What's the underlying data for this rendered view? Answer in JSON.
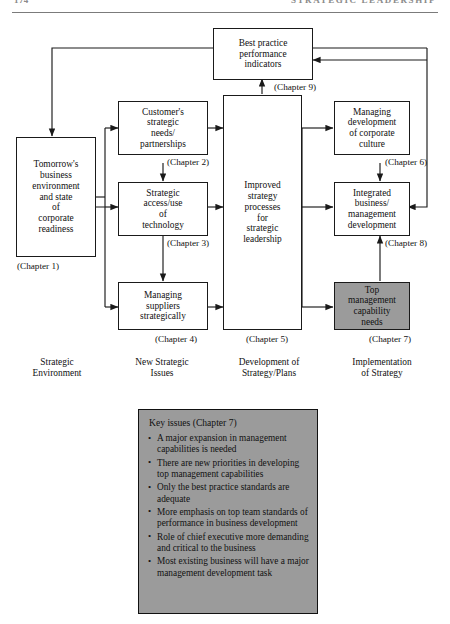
{
  "runhead": {
    "folio": "174",
    "title": "STRATEGIC LEADERSHIP"
  },
  "diagram": {
    "boxes": {
      "best_practice": "Best practice\nperformance\nindicators",
      "tomorrow": "Tomorrow's\nbusiness\nenvironment\nand state\nof\ncorporate\nreadiness",
      "customers": "Customer's\nstrategic\nneeds/\npartnerships",
      "technology": "Strategic\naccess/use\nof\ntechnology",
      "suppliers": "Managing\nsuppliers\nstrategically",
      "improved": "Improved\nstrategy\nprocesses\nfor\nstrategic\nleadership",
      "culture": "Managing\ndevelopment\nof corporate\nculture",
      "integrated": "Integrated\nbusiness/\nmanagement\ndevelopment",
      "topmgmt": "Top\nmanagement\ncapability\nneeds"
    },
    "chapters": {
      "best_practice": "(Chapter 9)",
      "tomorrow": "(Chapter 1)",
      "customers": "(Chapter 2)",
      "technology": "(Chapter 3)",
      "suppliers": "(Chapter 4)",
      "improved": "(Chapter 5)",
      "culture": "(Chapter 6)",
      "integrated": "(Chapter 8)",
      "topmgmt": "(Chapter 7)"
    },
    "column_labels": [
      "Strategic\nEnvironment",
      "New Strategic\nIssues",
      "Development of\nStrategy/Plans",
      "Implementation\nof Strategy"
    ],
    "shaded_fill": "#9b9b9b",
    "line_color": "#1a1a1a"
  },
  "key_issues": {
    "title": "Key issues (Chapter 7)",
    "bullets": [
      "A major expansion in management capabilities is needed",
      "There are new priorities in developing top management capabilities",
      "Only the best practice standards are adequate",
      "More emphasis on top team standards of performance in business development",
      "Role of chief executive more demanding and critical to the business",
      "Most existing business will have a major management development task"
    ]
  }
}
